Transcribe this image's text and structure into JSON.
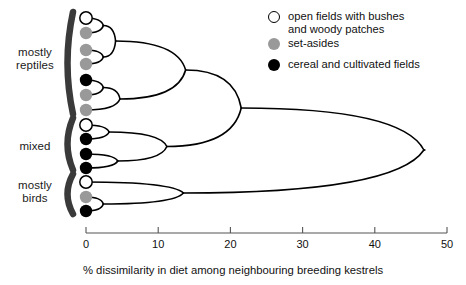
{
  "figure": {
    "type": "dendrogram",
    "background": "#ffffff",
    "line_color": "#000000"
  },
  "groups": [
    {
      "id": "mostly-reptiles",
      "label": "mostly\nreptiles",
      "label_x": 8,
      "label_y": 46,
      "label_w": 56,
      "bracket_top": 12,
      "bracket_bottom": 114
    },
    {
      "id": "mixed",
      "label": "mixed",
      "label_x": 8,
      "label_y": 140,
      "label_w": 56,
      "bracket_top": 118,
      "bracket_bottom": 170
    },
    {
      "id": "mostly-birds",
      "label": "mostly\nbirds",
      "label_x": 8,
      "label_y": 179,
      "label_w": 56,
      "bracket_top": 174,
      "bracket_bottom": 214
    }
  ],
  "legend": {
    "items": [
      {
        "name": "open-fields",
        "label": "open fields with bushes\nand woody patches",
        "fill": "#ffffff",
        "stroke": "#000000"
      },
      {
        "name": "set-asides",
        "label": "set-asides",
        "fill": "#999999",
        "stroke": "#999999"
      },
      {
        "name": "cereal-fields",
        "label": "cereal and cultivated fields",
        "fill": "#000000",
        "stroke": "#000000"
      }
    ]
  },
  "axis": {
    "label": "% dissimilarity in diet among neighbouring breeding kestrels",
    "min": 0,
    "max": 50,
    "ticks": [
      0,
      10,
      20,
      30,
      40,
      50
    ],
    "tick_labels": [
      "0",
      "10",
      "20",
      "30",
      "40",
      "50"
    ],
    "x_start_px": 86,
    "x_end_px": 447,
    "y_px": 233,
    "tick_len_px": 6,
    "color": "#555555"
  },
  "chart_data": {
    "type": "dendrogram",
    "title": "",
    "xlabel": "% dissimilarity in diet among neighbouring breeding kestrels",
    "ylabel": "",
    "xlim": [
      0,
      50
    ],
    "grid": false,
    "legend_position": "top-right",
    "leaves": [
      {
        "index": 0,
        "y": 18,
        "habitat": "open fields with bushes and woody patches",
        "fill": "#ffffff",
        "group": "mostly reptiles"
      },
      {
        "index": 1,
        "y": 33,
        "habitat": "set-asides",
        "fill": "#999999",
        "group": "mostly reptiles"
      },
      {
        "index": 2,
        "y": 50,
        "habitat": "set-asides",
        "fill": "#999999",
        "group": "mostly reptiles"
      },
      {
        "index": 3,
        "y": 64,
        "habitat": "set-asides",
        "fill": "#999999",
        "group": "mostly reptiles"
      },
      {
        "index": 4,
        "y": 80,
        "habitat": "cereal and cultivated fields",
        "fill": "#000000",
        "group": "mostly reptiles"
      },
      {
        "index": 5,
        "y": 95,
        "habitat": "set-asides",
        "fill": "#999999",
        "group": "mostly reptiles"
      },
      {
        "index": 6,
        "y": 110,
        "habitat": "set-asides",
        "fill": "#999999",
        "group": "mostly reptiles"
      },
      {
        "index": 7,
        "y": 125,
        "habitat": "open fields with bushes and woody patches",
        "fill": "#ffffff",
        "group": "mixed"
      },
      {
        "index": 8,
        "y": 139,
        "habitat": "cereal and cultivated fields",
        "fill": "#000000",
        "group": "mixed"
      },
      {
        "index": 9,
        "y": 154,
        "habitat": "cereal and cultivated fields",
        "fill": "#000000",
        "group": "mixed"
      },
      {
        "index": 10,
        "y": 168,
        "habitat": "cereal and cultivated fields",
        "fill": "#000000",
        "group": "mixed"
      },
      {
        "index": 11,
        "y": 182,
        "habitat": "open fields with bushes and woody patches",
        "fill": "#ffffff",
        "group": "mostly birds"
      },
      {
        "index": 12,
        "y": 197,
        "habitat": "set-asides",
        "fill": "#999999",
        "group": "mostly birds"
      },
      {
        "index": 13,
        "y": 211,
        "habitat": "cereal and cultivated fields",
        "fill": "#000000",
        "group": "mostly birds"
      }
    ],
    "merges": [
      {
        "id": "m1",
        "children": [
          "leaf0",
          "leaf1"
        ],
        "dissimilarity": 2.4,
        "y": 25.5
      },
      {
        "id": "m2",
        "children": [
          "leaf2",
          "leaf3"
        ],
        "dissimilarity": 2.4,
        "y": 57.0
      },
      {
        "id": "m3",
        "children": [
          "m1",
          "m2"
        ],
        "dissimilarity": 4.1,
        "y": 41.0
      },
      {
        "id": "m4",
        "children": [
          "leaf4",
          "leaf5"
        ],
        "dissimilarity": 2.4,
        "y": 87.5
      },
      {
        "id": "m5",
        "children": [
          "m4",
          "leaf6"
        ],
        "dissimilarity": 4.7,
        "y": 99.0
      },
      {
        "id": "m6",
        "children": [
          "m3",
          "m5"
        ],
        "dissimilarity": 13.8,
        "y": 70.0
      },
      {
        "id": "m7",
        "children": [
          "leaf7",
          "leaf8"
        ],
        "dissimilarity": 3.2,
        "y": 132.0
      },
      {
        "id": "m8",
        "children": [
          "leaf9",
          "leaf10"
        ],
        "dissimilarity": 4.4,
        "y": 161.0
      },
      {
        "id": "m9",
        "children": [
          "m7",
          "m8"
        ],
        "dissimilarity": 11.2,
        "y": 146.5
      },
      {
        "id": "m10",
        "children": [
          "m6",
          "m9"
        ],
        "dissimilarity": 21.5,
        "y": 108.0
      },
      {
        "id": "m11",
        "children": [
          "leaf12",
          "leaf13"
        ],
        "dissimilarity": 2.4,
        "y": 204.0
      },
      {
        "id": "m12",
        "children": [
          "leaf11",
          "m11"
        ],
        "dissimilarity": 13.5,
        "y": 193.0
      },
      {
        "id": "root",
        "children": [
          "m10",
          "m12"
        ],
        "dissimilarity": 46.8,
        "y": 150.0
      }
    ]
  }
}
